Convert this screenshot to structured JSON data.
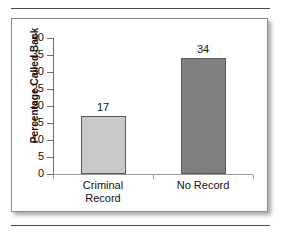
{
  "figure": {
    "frame_color": "#8d8d8d",
    "background": "#ffffff"
  },
  "chart_data": {
    "type": "bar",
    "title": "",
    "xlabel": "",
    "ylabel": "Percentage Called Back",
    "categories": [
      "Criminal Record",
      "No Record"
    ],
    "category_lines": [
      [
        "Criminal",
        "Record"
      ],
      [
        "No Record"
      ]
    ],
    "values": [
      17,
      34
    ],
    "value_labels": [
      "17",
      "34"
    ],
    "bar_colors": [
      "#c9c9c9",
      "#808080"
    ],
    "bar_border_color": "#5a5a5a",
    "ylim": [
      0,
      40
    ],
    "yticks": [
      0,
      5,
      10,
      15,
      20,
      25,
      30,
      35,
      40
    ],
    "ytick_labels": [
      "0",
      "5",
      "10",
      "15",
      "20",
      "25",
      "30",
      "35",
      "40"
    ],
    "grid": false,
    "legend": null
  }
}
